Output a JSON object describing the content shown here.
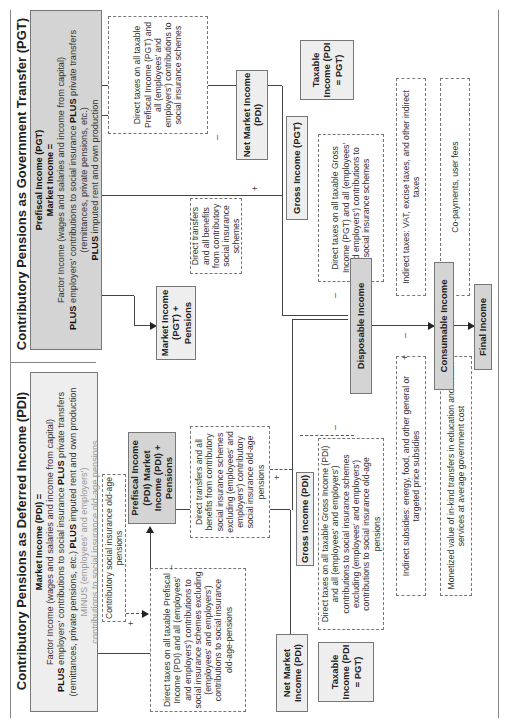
{
  "panels": {
    "left": {
      "title": "Contributory Pensions as Deferred Income (PDI)",
      "market_income": {
        "heading": "Market Income (PDI) =",
        "line1": "Factor Income (wages and salaries and income from capital)",
        "line2_bold": "PLUS",
        "line2": " employers' contributions to social insurance ",
        "line2b_bold": "PLUS",
        "line2b": " private transfers",
        "line3": "(remittances, private pensions, etc.) ",
        "line3_bold": "PLUS",
        "line3b": " imputed rent and own production",
        "line4": "MINUS (employees' and employers')",
        "line5": "contributions to social insurance old-age pensions"
      },
      "contrib_pensions_note": "Contributory social insurance old-age pensions",
      "prefiscal_box": "Prefiscal Income (PDI) Market Income (PDI) + Pensions",
      "direct_taxes_note": "Direct taxes on all taxable Prefiscal Income (PDI) and all (employees' and employers') contributions to social insurance schemes excluding (employees' and employers') contributions to social insurance old-age-pensions",
      "net_market_income": "Net Market Income (PDI)",
      "direct_transfers_note": "Direct transfers and all benefits from contributory social insurance schemes excluding (employees' and employers') contributory social insurance old-age pensions",
      "gross_income": "Gross Income (PDI)",
      "direct_taxes_gross_note": "Direct taxes on all taxable Gross Income (PDI) and all (employees' and employers') contributions to social insurance schemes excluding (employees' and employers') contributions to social insurance old-age pensions",
      "taxable_income": "Taxable Income (PDI = PGT)",
      "indirect_subsidies_note": "Indirect subsidies: energy, food, and other general or targeted price subsidies",
      "in_kind_note": "Monetized value of in-kind transfers in education and health services at average government cost"
    },
    "right": {
      "title": "Contributory Pensions as Government Transfer (PGT)",
      "market_income": {
        "heading1": "Prefiscal Income (PGT)",
        "heading2": "Market Income =",
        "line1": "Factor Income (wages and salaries and income from capital)",
        "line2_bold": "PLUS",
        "line2": " employers' contributions to social insurance ",
        "line2b_bold": "PLUS",
        "line2b": " private transfers",
        "line3": "(remittances, private pensions, etc.)",
        "line4_bold": "PLUS",
        "line4": " imputed rent and own production"
      },
      "market_plus_pensions": "Market Income (PGT) + Pensions",
      "direct_taxes_note": "Direct taxes on all taxable Prefiscal Income (PGT) and all (employees' and employers') contributions to social insurance schemes",
      "net_market_income": "Net Market Income (PDI)",
      "direct_transfers_note": "Direct transfers and all benefits from contributory social insurance schemes",
      "gross_income": "Gross Income (PGT)",
      "taxable_income": "Taxable Income (PDI = PGT)",
      "direct_taxes_gross_note": "Direct taxes on all taxable Gross Income (PGT) and all (employees' and employers') contributions to social insurance schemes",
      "indirect_taxes_note": "Indirect taxes: VAT, excise taxes, and other indirect taxes",
      "copayments_note": "Co-payments, user fees"
    }
  },
  "shared": {
    "disposable_income": "Disposable Income",
    "consumable_income": "Consumable Income",
    "final_income": "Final Income"
  },
  "signs": {
    "plus": "+",
    "minus": "–"
  }
}
